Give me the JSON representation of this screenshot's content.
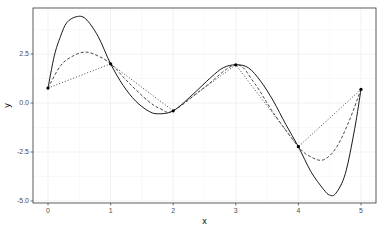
{
  "chart_data": {
    "type": "line",
    "title": "",
    "xlabel": "x",
    "ylabel": "y",
    "xlim": [
      -0.25,
      5.25
    ],
    "ylim": [
      -5.1,
      4.85
    ],
    "x_ticks": [
      0,
      1,
      2,
      3,
      4,
      5
    ],
    "x_tick_labels": [
      "0",
      "1",
      "2",
      "3",
      "4",
      "5"
    ],
    "y_ticks": [
      -5.0,
      -2.5,
      2.5
    ],
    "y_tick_labels": [
      "-5.0",
      "-2.5",
      "2.5"
    ],
    "y_ticks_all": [
      -5.0,
      -2.5,
      0.0,
      2.5
    ],
    "y_tick_labels_all": [
      "-5.0",
      "-2.5",
      "0.0",
      "2.5"
    ],
    "grid": true,
    "legend": "none",
    "points": {
      "x": [
        0,
        1,
        2,
        3,
        4,
        5
      ],
      "y": [
        0.76,
        2.0,
        -0.4,
        1.95,
        -2.23,
        0.7
      ]
    },
    "series": [
      {
        "name": "solid-interpolation",
        "style": "solid",
        "x": [
          0,
          0.1,
          0.2,
          0.3,
          0.45,
          0.6,
          0.8,
          1.0,
          1.2,
          1.4,
          1.6,
          1.75,
          2.0,
          2.3,
          2.6,
          2.8,
          3.0,
          3.2,
          3.4,
          3.6,
          3.8,
          4.0,
          4.2,
          4.4,
          4.5,
          4.6,
          4.75,
          4.9,
          5.0
        ],
        "y": [
          0.76,
          2.4,
          3.4,
          4.1,
          4.4,
          4.3,
          3.4,
          2.0,
          0.9,
          0.1,
          -0.4,
          -0.55,
          -0.4,
          0.4,
          1.3,
          1.8,
          1.95,
          1.8,
          1.1,
          0.1,
          -1.1,
          -2.23,
          -3.5,
          -4.4,
          -4.7,
          -4.6,
          -3.6,
          -1.3,
          0.7
        ]
      },
      {
        "name": "dashed-interpolation",
        "style": "dashed",
        "x": [
          0,
          0.2,
          0.4,
          0.6,
          0.8,
          1.0,
          1.3,
          1.6,
          1.8,
          2.0,
          2.5,
          3.0,
          3.3,
          3.6,
          4.0,
          4.2,
          4.4,
          4.6,
          4.8,
          5.0
        ],
        "y": [
          0.76,
          1.9,
          2.4,
          2.6,
          2.4,
          2.0,
          1.0,
          0.1,
          -0.3,
          -0.4,
          0.8,
          1.95,
          1.0,
          -0.5,
          -2.23,
          -2.75,
          -2.9,
          -2.3,
          -1.0,
          0.7
        ]
      },
      {
        "name": "dotted-linear",
        "style": "dotted",
        "x": [
          0,
          1,
          2,
          3,
          4,
          5
        ],
        "y": [
          0.76,
          2.0,
          -0.4,
          1.95,
          -2.23,
          0.7
        ]
      }
    ]
  },
  "labels": {
    "xlabel": "x",
    "ylabel": "y"
  }
}
